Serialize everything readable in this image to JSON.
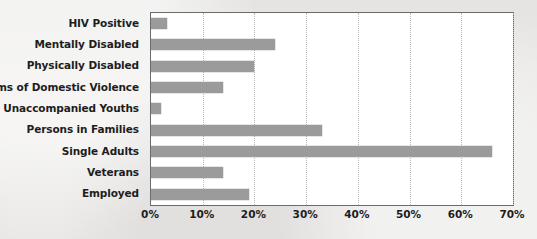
{
  "chart_data": {
    "type": "bar",
    "orientation": "horizontal",
    "title": "",
    "subtitle": "",
    "xlabel": "",
    "ylabel": "",
    "categories": [
      "HIV Positive",
      "Mentally Disabled",
      "Physically Disabled",
      "Victims of Domestic Violence",
      "Unaccompanied Youths",
      "Persons in Families",
      "Single Adults",
      "Veterans",
      "Employed"
    ],
    "values": [
      3,
      24,
      20,
      14,
      2,
      33,
      66,
      14,
      19
    ],
    "value_unit": "%",
    "xlim": [
      0,
      70
    ],
    "xticks": [
      0,
      10,
      20,
      30,
      40,
      50,
      60,
      70
    ],
    "xtick_labels": [
      "0%",
      "10%",
      "20%",
      "30%",
      "40%",
      "50%",
      "60%",
      "70%"
    ],
    "grid": "vertical-dotted",
    "legend": "none",
    "series": [
      {
        "name": "",
        "values": [
          3,
          24,
          20,
          14,
          2,
          33,
          66,
          14,
          19
        ]
      }
    ],
    "colors": {
      "bar": "#9b9b9b",
      "plot_background": "#ffffff",
      "page_background": "#e9e8e6",
      "frame": "#6b6b6b",
      "gridline": "#b9b9b9",
      "text": "#1d1d1d"
    }
  }
}
